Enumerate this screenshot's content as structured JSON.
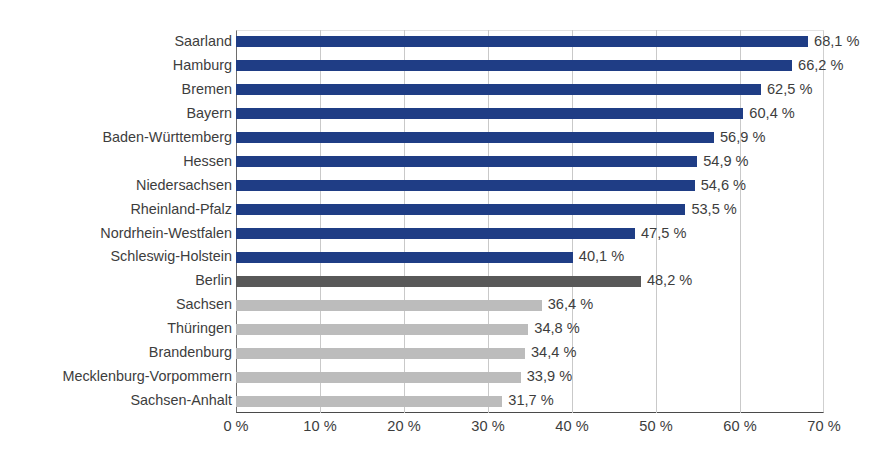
{
  "chart_data": {
    "type": "bar",
    "orientation": "horizontal",
    "title": "",
    "xlabel": "",
    "ylabel": "",
    "xlim": [
      0,
      70
    ],
    "xticks": [
      0,
      10,
      20,
      30,
      40,
      50,
      60,
      70
    ],
    "xtick_labels": [
      "0 %",
      "10 %",
      "20 %",
      "30 %",
      "40 %",
      "50 %",
      "60 %",
      "70 %"
    ],
    "grid": true,
    "grid_axis": "x",
    "legend": false,
    "value_suffix": " %",
    "decimal_separator": ",",
    "categories": [
      "Saarland",
      "Hamburg",
      "Bremen",
      "Bayern",
      "Baden-Württemberg",
      "Hessen",
      "Niedersachsen",
      "Rheinland-Pfalz",
      "Nordrhein-Westfalen",
      "Schleswig-Holstein",
      "Berlin",
      "Sachsen",
      "Thüringen",
      "Brandenburg",
      "Mecklenburg-Vorpommern",
      "Sachsen-Anhalt"
    ],
    "values": [
      68.1,
      66.2,
      62.5,
      60.4,
      56.9,
      54.9,
      54.6,
      53.5,
      47.5,
      40.1,
      48.2,
      36.4,
      34.8,
      34.4,
      33.9,
      31.7
    ],
    "value_labels": [
      "68,1 %",
      "66,2 %",
      "62,5 %",
      "60,4 %",
      "56,9 %",
      "54,9 %",
      "54,6 %",
      "53,5 %",
      "47,5 %",
      "40,1 %",
      "48,2 %",
      "36,4 %",
      "34,8 %",
      "34,4 %",
      "33,9 %",
      "31,7 %"
    ],
    "bar_groups": [
      "west",
      "west",
      "west",
      "west",
      "west",
      "west",
      "west",
      "west",
      "west",
      "west",
      "berlin",
      "east",
      "east",
      "east",
      "east",
      "east"
    ],
    "colors": {
      "west": "#1f3d85",
      "berlin": "#585858",
      "east": "#bcbcbc",
      "gridline": "#c9c9c9",
      "axis": "#4a4a4a",
      "text": "#3d3d3d"
    }
  }
}
